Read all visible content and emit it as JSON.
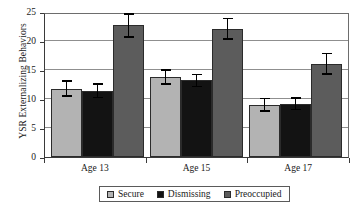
{
  "chart_data": {
    "type": "bar",
    "title": "",
    "xlabel": "",
    "ylabel": "YSR Externalizing Behaviors",
    "categories": [
      "Age 13",
      "Age 15",
      "Age 17"
    ],
    "ylim": [
      0,
      25
    ],
    "yticks": [
      0,
      5,
      10,
      15,
      20,
      25
    ],
    "grid": true,
    "legend_position": "bottom",
    "series": [
      {
        "name": "Secure",
        "color": "#b3b3b3",
        "values": [
          11.8,
          13.8,
          9.0
        ],
        "errors": [
          1.4,
          1.3,
          1.2
        ]
      },
      {
        "name": "Dismissing",
        "color": "#131313",
        "values": [
          11.4,
          13.2,
          9.2
        ],
        "errors": [
          1.3,
          1.2,
          1.1
        ]
      },
      {
        "name": "Preoccupied",
        "color": "#5c5c5c",
        "values": [
          22.7,
          22.1,
          16.1
        ],
        "errors": [
          2.1,
          1.9,
          1.9
        ]
      }
    ]
  },
  "axis": {
    "y_tick_labels": [
      "25",
      "20",
      "15",
      "10",
      "5",
      "0"
    ]
  },
  "legend": {
    "items": [
      {
        "label": "Secure"
      },
      {
        "label": "Dismissing"
      },
      {
        "label": "Preoccupied"
      }
    ]
  }
}
